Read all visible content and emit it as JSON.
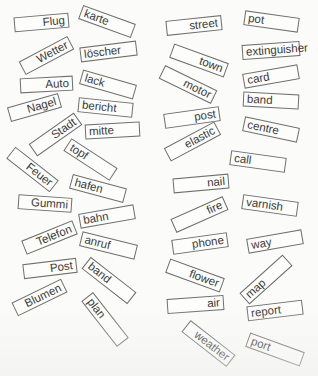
{
  "worksheet": {
    "background": "#fbfbfa",
    "border_color": "#6e6e6e",
    "text_color": "#3a3a3a",
    "german_cards": [
      {
        "label": "Flug",
        "cx": 41,
        "cy": 22,
        "w": 55,
        "h": 15,
        "angle": -5,
        "align": "right"
      },
      {
        "label": "karte",
        "cx": 107,
        "cy": 21,
        "w": 56,
        "h": 15,
        "angle": 20,
        "align": "left"
      },
      {
        "label": "Wetter",
        "cx": 46,
        "cy": 55,
        "w": 55,
        "h": 15,
        "angle": -28,
        "align": "right"
      },
      {
        "label": "löscher",
        "cx": 108,
        "cy": 51,
        "w": 57,
        "h": 15,
        "angle": -7,
        "align": "left"
      },
      {
        "label": "Auto",
        "cx": 46,
        "cy": 84,
        "w": 53,
        "h": 15,
        "angle": -3,
        "align": "right"
      },
      {
        "label": "lack",
        "cx": 108,
        "cy": 84,
        "w": 56,
        "h": 15,
        "angle": 16,
        "align": "left"
      },
      {
        "label": "Nagel",
        "cx": 34,
        "cy": 107,
        "w": 53,
        "h": 15,
        "angle": -16,
        "align": "right"
      },
      {
        "label": "bericht",
        "cx": 105,
        "cy": 107,
        "w": 55,
        "h": 15,
        "angle": 6,
        "align": "left"
      },
      {
        "label": "Stadt",
        "cx": 55,
        "cy": 134,
        "w": 55,
        "h": 15,
        "angle": -35,
        "align": "right"
      },
      {
        "label": "mitte",
        "cx": 112,
        "cy": 130,
        "w": 55,
        "h": 15,
        "angle": -3,
        "align": "left"
      },
      {
        "label": "Feuer",
        "cx": 32,
        "cy": 169,
        "w": 55,
        "h": 15,
        "angle": 38,
        "align": "right"
      },
      {
        "label": "topf",
        "cx": 90,
        "cy": 159,
        "w": 55,
        "h": 15,
        "angle": 33,
        "align": "left"
      },
      {
        "label": "hafen",
        "cx": 98,
        "cy": 188,
        "w": 56,
        "h": 15,
        "angle": 15,
        "align": "left"
      },
      {
        "label": "Gummi",
        "cx": 45,
        "cy": 203,
        "w": 54,
        "h": 15,
        "angle": 4,
        "align": "right"
      },
      {
        "label": "bahn",
        "cx": 107,
        "cy": 216,
        "w": 56,
        "h": 15,
        "angle": -10,
        "align": "left"
      },
      {
        "label": "Telefon",
        "cx": 49,
        "cy": 237,
        "w": 55,
        "h": 15,
        "angle": -22,
        "align": "right"
      },
      {
        "label": "anruf",
        "cx": 108,
        "cy": 245,
        "w": 57,
        "h": 15,
        "angle": 14,
        "align": "left"
      },
      {
        "label": "Post",
        "cx": 50,
        "cy": 268,
        "w": 54,
        "h": 15,
        "angle": -7,
        "align": "right"
      },
      {
        "label": "band",
        "cx": 109,
        "cy": 280,
        "w": 58,
        "h": 15,
        "angle": 38,
        "align": "left"
      },
      {
        "label": "Blumen",
        "cx": 39,
        "cy": 297,
        "w": 55,
        "h": 15,
        "angle": -26,
        "align": "right"
      },
      {
        "label": "plan",
        "cx": 105,
        "cy": 319,
        "w": 58,
        "h": 15,
        "angle": 52,
        "align": "left"
      }
    ],
    "english_cards": [
      {
        "label": "street",
        "cx": 34,
        "cy": 25,
        "w": 56,
        "h": 15,
        "angle": -6,
        "align": "right"
      },
      {
        "label": "pot",
        "cx": 111,
        "cy": 21,
        "w": 55,
        "h": 15,
        "angle": 8,
        "align": "left"
      },
      {
        "label": "town",
        "cx": 39,
        "cy": 60,
        "w": 58,
        "h": 15,
        "angle": 20,
        "align": "right"
      },
      {
        "label": "extinguisher",
        "cx": 111,
        "cy": 50,
        "w": 58,
        "h": 15,
        "angle": -4,
        "align": "left"
      },
      {
        "label": "motor",
        "cx": 28,
        "cy": 84,
        "w": 58,
        "h": 15,
        "angle": 26,
        "align": "right"
      },
      {
        "label": "card",
        "cx": 111,
        "cy": 76,
        "w": 56,
        "h": 15,
        "angle": -10,
        "align": "left"
      },
      {
        "label": "band",
        "cx": 111,
        "cy": 100,
        "w": 56,
        "h": 15,
        "angle": 3,
        "align": "left"
      },
      {
        "label": "post",
        "cx": 32,
        "cy": 117,
        "w": 56,
        "h": 15,
        "angle": -8,
        "align": "right"
      },
      {
        "label": "centre",
        "cx": 111,
        "cy": 129,
        "w": 56,
        "h": 15,
        "angle": 12,
        "align": "left"
      },
      {
        "label": "elastic",
        "cx": 32,
        "cy": 141,
        "w": 57,
        "h": 15,
        "angle": -28,
        "align": "right"
      },
      {
        "label": "call",
        "cx": 98,
        "cy": 161,
        "w": 56,
        "h": 15,
        "angle": 8,
        "align": "left"
      },
      {
        "label": "nail",
        "cx": 41,
        "cy": 183,
        "w": 56,
        "h": 15,
        "angle": -5,
        "align": "right"
      },
      {
        "label": "fire",
        "cx": 39,
        "cy": 214,
        "w": 57,
        "h": 15,
        "angle": -24,
        "align": "right"
      },
      {
        "label": "varnish",
        "cx": 110,
        "cy": 205,
        "w": 56,
        "h": 15,
        "angle": 8,
        "align": "left"
      },
      {
        "label": "phone",
        "cx": 40,
        "cy": 243,
        "w": 56,
        "h": 15,
        "angle": -8,
        "align": "right"
      },
      {
        "label": "way",
        "cx": 115,
        "cy": 241,
        "w": 56,
        "h": 15,
        "angle": -10,
        "align": "left"
      },
      {
        "label": "flower",
        "cx": 35,
        "cy": 275,
        "w": 58,
        "h": 15,
        "angle": 20,
        "align": "right"
      },
      {
        "label": "map",
        "cx": 106,
        "cy": 279,
        "w": 58,
        "h": 15,
        "angle": -42,
        "align": "left"
      },
      {
        "label": "air",
        "cx": 35,
        "cy": 304,
        "w": 57,
        "h": 15,
        "angle": -4,
        "align": "right"
      },
      {
        "label": "report",
        "cx": 115,
        "cy": 310,
        "w": 56,
        "h": 15,
        "angle": -7,
        "align": "left"
      },
      {
        "label": "weather",
        "cx": 48,
        "cy": 343,
        "w": 57,
        "h": 15,
        "angle": 38,
        "align": "right"
      },
      {
        "label": "port",
        "cx": 115,
        "cy": 349,
        "w": 58,
        "h": 15,
        "angle": 20,
        "align": "left"
      }
    ]
  }
}
